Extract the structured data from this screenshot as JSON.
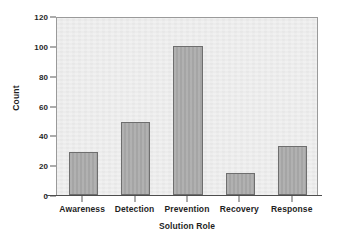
{
  "chart_data": {
    "type": "bar",
    "title": "",
    "subtitle": "",
    "xlabel": "Solution Role",
    "ylabel": "Count",
    "categories": [
      "Awareness",
      "Detection",
      "Prevention",
      "Recovery",
      "Response"
    ],
    "values": [
      29,
      49,
      100,
      15,
      33
    ],
    "series": [
      {
        "name": "Count",
        "values": [
          29,
          49,
          100,
          15,
          33
        ]
      }
    ],
    "ylim": [
      0,
      120
    ],
    "yticks": [
      0,
      20,
      40,
      60,
      80,
      100,
      120
    ],
    "ytick_labels": [
      "0",
      "20",
      "40",
      "60",
      "80",
      "100",
      "120"
    ],
    "xtick_labels": [
      "Awareness",
      "Detection",
      "Prevention",
      "Recovery",
      "Response"
    ],
    "grid": false,
    "legend": null,
    "legend_position": "none",
    "annotations": [],
    "orientation": "vertical",
    "bar_count": 5
  },
  "style": {
    "bar_fill": "#a8a8a8",
    "bar_border": "#6e6e6e",
    "plot_background": "#ececec",
    "frame_color": "#9a9a9a",
    "axis_line_color": "#4d4d4d",
    "tick_color": "#5a5a5a",
    "text_color": "#1f1f1f",
    "figure_background": "#ffffff"
  }
}
